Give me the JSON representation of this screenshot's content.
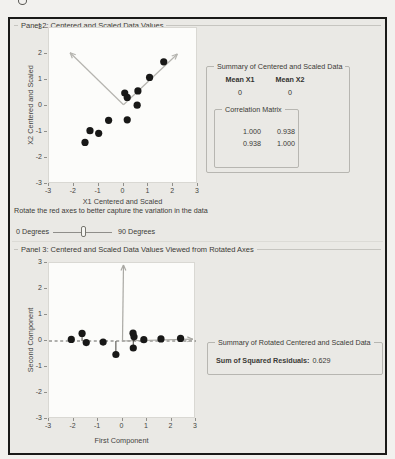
{
  "panel2": {
    "title": "Panel 2: Centered and Scaled Data Values",
    "summary": {
      "title": "Summary of Centered and Scaled Data",
      "headers": [
        "Mean X1",
        "Mean X2"
      ],
      "values": [
        "0",
        "0"
      ],
      "correlation": {
        "title": "Correlation Matrix",
        "matrix": [
          [
            "1.000",
            "0.938"
          ],
          [
            "0.938",
            "1.000"
          ]
        ]
      }
    }
  },
  "rotation_control": {
    "instruction": "Rotate the red axes to better capture the variation in the data",
    "min_label": "0 Degrees",
    "max_label": "90 Degrees",
    "value_fraction": 0.52
  },
  "panel3": {
    "title": "Panel 3: Centered and Scaled Data Values Viewed from Rotated Axes",
    "summary": {
      "title": "Summary of Rotated Centered and Scaled Data",
      "label": "Sum of Squared Residuals:",
      "value": "0.629"
    }
  },
  "chart_data": [
    {
      "type": "scatter",
      "panel": "Panel 2: Centered and Scaled Data Values",
      "xlabel": "X1 Centered and Scaled",
      "ylabel": "X2 Centered and Scaled",
      "xlim": [
        -3,
        3
      ],
      "ylim": [
        -3,
        3
      ],
      "xticks": [
        -3,
        -2,
        -1,
        0,
        1,
        2,
        3
      ],
      "yticks": [
        3,
        2,
        1,
        0,
        -1,
        -2,
        -3
      ],
      "points": [
        [
          -1.55,
          -1.4
        ],
        [
          -1.35,
          -0.95
        ],
        [
          -1.0,
          -1.05
        ],
        [
          -0.6,
          -0.55
        ],
        [
          0.15,
          -0.53
        ],
        [
          0.05,
          0.5
        ],
        [
          0.15,
          0.33
        ],
        [
          0.55,
          0.03
        ],
        [
          0.58,
          0.58
        ],
        [
          1.05,
          1.1
        ],
        [
          1.62,
          1.7
        ]
      ],
      "rotated_axis_arrows": [
        {
          "from": [
            0,
            0.05
          ],
          "to": [
            -2.15,
            2.05
          ]
        },
        {
          "from": [
            0,
            0.05
          ],
          "to": [
            2.17,
            2.0
          ]
        }
      ],
      "arrow_color": "#b5b4af",
      "point_color": "#181817"
    },
    {
      "type": "scatter",
      "panel": "Panel 3: Centered and Scaled Data Values Viewed from Rotated Axes",
      "xlabel": "First Component",
      "ylabel": "Second Component",
      "xlim": [
        -3,
        3
      ],
      "ylim": [
        -3,
        3
      ],
      "xticks": [
        -3,
        -2,
        -1,
        0,
        1,
        2,
        3
      ],
      "yticks": [
        3,
        2,
        1,
        0,
        -1,
        -2,
        -3
      ],
      "points": [
        [
          -2.09,
          0.06
        ],
        [
          -1.65,
          0.29
        ],
        [
          -1.48,
          -0.06
        ],
        [
          -0.79,
          -0.04
        ],
        [
          -0.27,
          -0.52
        ],
        [
          0.43,
          0.3
        ],
        [
          0.47,
          0.16
        ],
        [
          0.44,
          -0.27
        ],
        [
          0.87,
          0.05
        ],
        [
          1.57,
          0.08
        ],
        [
          2.37,
          0.1
        ]
      ],
      "reference_line_y": 0,
      "residual_lines": true,
      "axis_arrows": [
        {
          "from": [
            0,
            0
          ],
          "to": [
            2.87,
            0.07
          ]
        },
        {
          "from": [
            0,
            0
          ],
          "to": [
            0.04,
            2.92
          ]
        }
      ],
      "arrow_color": "#a9a8a3",
      "point_color": "#181817"
    }
  ]
}
